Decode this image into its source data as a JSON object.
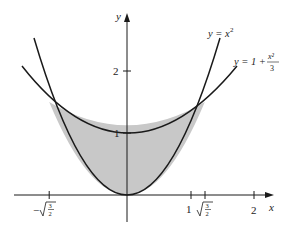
{
  "figure": {
    "axes": {
      "x_label": "x",
      "y_label": "y",
      "x_ticks": [
        {
          "value": -1.2247,
          "label": "-√(3/2)"
        },
        {
          "value": 1,
          "label": "1"
        },
        {
          "value": 1.2247,
          "label": "√(3/2)"
        },
        {
          "value": 2,
          "label": "2"
        }
      ],
      "y_ticks": [
        {
          "value": 1,
          "label": "1"
        },
        {
          "value": 2,
          "label": "2"
        }
      ]
    },
    "curves": [
      {
        "name": "parabola",
        "label_lhs": "y = x",
        "label_exp": "2",
        "equation": "y = x^2"
      },
      {
        "name": "shallow-parabola",
        "label_lhs": "y = 1 + ",
        "label_num": "x²",
        "label_den": "3",
        "equation": "y = 1 + x^2/3"
      }
    ],
    "intersections": [
      {
        "x": -1.2247,
        "y": 1.5
      },
      {
        "x": 1.2247,
        "y": 1.5
      }
    ],
    "labels": {
      "tick_1": "1",
      "tick_2": "2",
      "ytick_1": "1",
      "ytick_2": "2",
      "neg_root_minus": "−",
      "root_num": "3",
      "root_den": "2"
    },
    "colors": {
      "shade": "#c8c8c8",
      "stroke": "#1a1a1a",
      "background": "#ffffff"
    }
  }
}
